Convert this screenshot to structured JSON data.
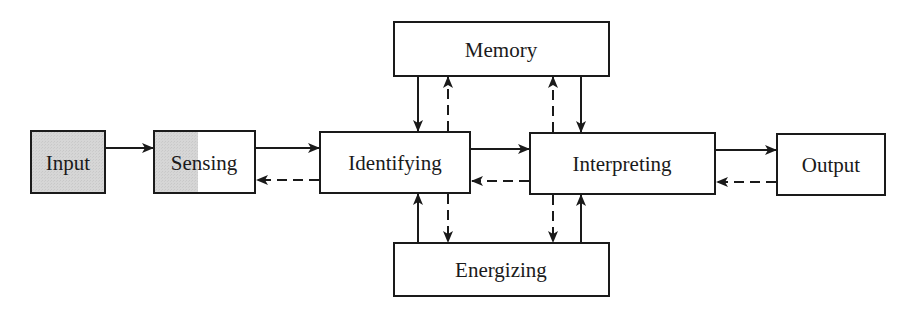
{
  "diagram": {
    "type": "block-flow",
    "colors": {
      "stroke": "#1a1a1a",
      "shaded_fill": "#d4d4d4",
      "box_fill": "#ffffff"
    },
    "nodes": [
      {
        "id": "input",
        "label": "Input",
        "shaded": "full"
      },
      {
        "id": "sensing",
        "label": "Sensing",
        "shaded": "partial-left"
      },
      {
        "id": "identifying",
        "label": "Identifying",
        "shaded": "none"
      },
      {
        "id": "interpreting",
        "label": "Interpreting",
        "shaded": "none"
      },
      {
        "id": "output",
        "label": "Output",
        "shaded": "none"
      },
      {
        "id": "memory",
        "label": "Memory",
        "shaded": "none"
      },
      {
        "id": "energizing",
        "label": "Energizing",
        "shaded": "none"
      }
    ],
    "edges": [
      {
        "from": "input",
        "to": "sensing",
        "style": "solid"
      },
      {
        "from": "sensing",
        "to": "identifying",
        "style": "solid"
      },
      {
        "from": "identifying",
        "to": "sensing",
        "style": "dashed"
      },
      {
        "from": "identifying",
        "to": "interpreting",
        "style": "solid"
      },
      {
        "from": "interpreting",
        "to": "identifying",
        "style": "dashed"
      },
      {
        "from": "interpreting",
        "to": "output",
        "style": "solid"
      },
      {
        "from": "output",
        "to": "interpreting",
        "style": "dashed"
      },
      {
        "from": "memory",
        "to": "identifying",
        "style": "solid"
      },
      {
        "from": "identifying",
        "to": "memory",
        "style": "dashed"
      },
      {
        "from": "interpreting",
        "to": "memory",
        "style": "dashed"
      },
      {
        "from": "memory",
        "to": "interpreting",
        "style": "solid"
      },
      {
        "from": "energizing",
        "to": "identifying",
        "style": "solid"
      },
      {
        "from": "identifying",
        "to": "energizing",
        "style": "dashed"
      },
      {
        "from": "interpreting",
        "to": "energizing",
        "style": "dashed"
      },
      {
        "from": "energizing",
        "to": "interpreting",
        "style": "solid"
      }
    ]
  }
}
